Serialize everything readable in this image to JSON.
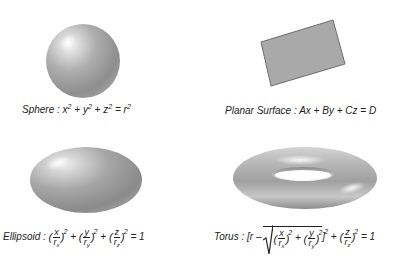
{
  "figure": {
    "panels": [
      {
        "id": "sphere",
        "name": "Sphere",
        "equation_text": "x^2 + y^2 + z^2 = r^2",
        "parts": {
          "name": "Sphere",
          "sep": ":",
          "t1": "x",
          "p1": "2",
          "plus1": "+",
          "t2": "y",
          "p2": "2",
          "plus2": "+",
          "t3": "z",
          "p3": "2",
          "eq": "=",
          "t4": "r",
          "p4": "2"
        }
      },
      {
        "id": "planar-surface",
        "name": "Planar Surface",
        "equation_text": "Ax + By + Cz = D",
        "parts": {
          "name": "Planar Surface",
          "sep": ":",
          "expr": "Ax + By + Cz = D"
        }
      },
      {
        "id": "ellipsoid",
        "name": "Ellipsoid",
        "equation_text": "(x/r_x)^2 + (y/r_y)^2 + (z/r_z)^2 = 1",
        "parts": {
          "name": "Ellipsoid",
          "sep": ":",
          "lp": "(",
          "rp": ")",
          "num1": "x",
          "den1": "r",
          "sub1": "x",
          "num2": "y",
          "den2": "r",
          "sub2": "y",
          "num3": "z",
          "den3": "r",
          "sub3": "z",
          "pow": "2",
          "plus": "+",
          "eq": "= 1"
        }
      },
      {
        "id": "torus",
        "name": "Torus",
        "equation_text": "[r - sqrt((x/r_x)^2 + (y/r_y)^2)]^2 + (z/r_z)^2 = 1",
        "parts": {
          "name": "Torus",
          "sep": ":",
          "open": "[r –",
          "lp": "(",
          "rp": ")",
          "num1": "x",
          "den1": "r",
          "sub1": "x",
          "num2": "y",
          "den2": "r",
          "sub2": "y",
          "close": "]",
          "num3": "z",
          "den3": "r",
          "sub3": "z",
          "pow": "2",
          "plus": "+",
          "eq": "= 1"
        }
      }
    ],
    "colors": {
      "surface_light": "#e8e8e8",
      "surface_mid": "#a8a8a8",
      "surface_dark": "#7a7a7a",
      "plane_fill": "#a9a9a9",
      "plane_edge": "#6e6e6e",
      "text": "#222222"
    }
  }
}
